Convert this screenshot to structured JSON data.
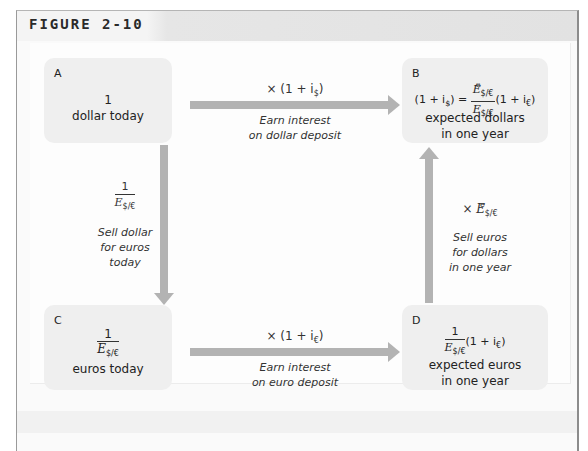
{
  "figure": {
    "label": "FIGURE 2-10"
  },
  "boxes": {
    "A": {
      "letter": "A",
      "line1": "1",
      "line2": "dollar today"
    },
    "B": {
      "letter": "B",
      "eq_left": "(1 + i",
      "eq_left_sub": "$",
      "eq_left_close": ")",
      "eq_equals": "=",
      "frac_num": "E",
      "frac_num_sup": "e",
      "frac_num_sub": "$/€",
      "frac_den": "E",
      "frac_den_sub": "$/€",
      "eq_right": "(1 + i",
      "eq_right_sub": "€",
      "eq_right_close": ")",
      "line1": "expected dollars",
      "line2": "in one year"
    },
    "C": {
      "letter": "C",
      "frac_num": "1",
      "frac_den": "E",
      "frac_den_sub": "$/€",
      "line1": "euros today"
    },
    "D": {
      "letter": "D",
      "frac_num": "1",
      "frac_den": "E",
      "frac_den_sub": "$/€",
      "eq_right": "(1 + i",
      "eq_right_sub": "€",
      "eq_right_close": ")",
      "line1": "expected euros",
      "line2": "in one year"
    }
  },
  "arrows": {
    "top": {
      "op": "× (1 + i",
      "op_sub": "$",
      "op_close": ")",
      "caption1": "Earn interest",
      "caption2": "on dollar deposit"
    },
    "bottom": {
      "op": "× (1 + i",
      "op_sub": "€",
      "op_close": ")",
      "caption1": "Earn interest",
      "caption2": "on euro deposit"
    },
    "left": {
      "frac_num": "1",
      "frac_den": "E",
      "frac_den_sub": "$/€",
      "caption1": "Sell dollar",
      "caption2": "for euros",
      "caption3": "today"
    },
    "right": {
      "op": "× E",
      "op_sup": "e",
      "op_sub": "$/€",
      "caption1": "Sell euros",
      "caption2": "for dollars",
      "caption3": "in one year"
    }
  },
  "colors": {
    "box_fill": "#efefef",
    "arrow": "#b3b3b3",
    "title_bar": "#e2e2e2"
  }
}
